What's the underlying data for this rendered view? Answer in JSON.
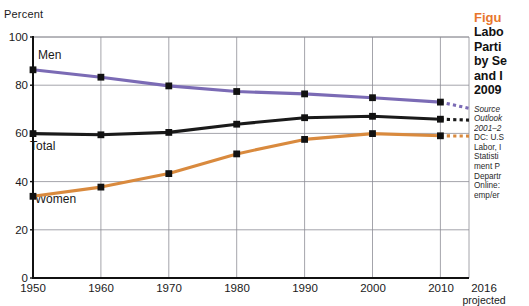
{
  "chart_data": {
    "type": "line",
    "xlabel": "",
    "ylabel": "Percent",
    "ylim": [
      0,
      100
    ],
    "yticks": [
      0,
      20,
      40,
      60,
      80,
      100
    ],
    "grid": true,
    "legend": "inline-labels",
    "x": [
      "1950",
      "1960",
      "1970",
      "1980",
      "1990",
      "2000",
      "2010",
      "2016"
    ],
    "projection_starts_after": "2010",
    "series": [
      {
        "name": "Men",
        "color": "#7B6BB5",
        "values": [
          86.4,
          83.3,
          79.7,
          77.4,
          76.4,
          74.8,
          73.0,
          70.4
        ]
      },
      {
        "name": "Total",
        "color": "#1A1A1A",
        "values": [
          59.9,
          59.4,
          60.4,
          63.8,
          66.5,
          67.1,
          65.9,
          65.5
        ]
      },
      {
        "name": "Women",
        "color": "#D98A3E",
        "values": [
          33.9,
          37.7,
          43.3,
          51.5,
          57.5,
          59.9,
          59.0,
          58.9
        ]
      }
    ]
  },
  "axis": {
    "y_title": "Percent",
    "y_tick_labels": [
      "100",
      "80",
      "60",
      "40",
      "20",
      "0"
    ],
    "x_tick_labels": [
      "1950",
      "1960",
      "1970",
      "1980",
      "1990",
      "2000",
      "2010"
    ],
    "x_tick_projected": "2016",
    "projected_note": "projected"
  },
  "series_labels": {
    "men": "Men",
    "total": "Total",
    "women": "Women"
  },
  "sidebar": {
    "kicker": "Figu",
    "title_lines": [
      "Labo",
      "Parti",
      "by Se",
      "and I",
      "2009"
    ],
    "source_lines": [
      "Source",
      "Outlook",
      "2001–2",
      "DC: U.S",
      "Labor, I",
      "Statisti",
      "ment P",
      "Departr",
      "Online:",
      "emp/er"
    ],
    "accent_color": "#E8762C"
  }
}
